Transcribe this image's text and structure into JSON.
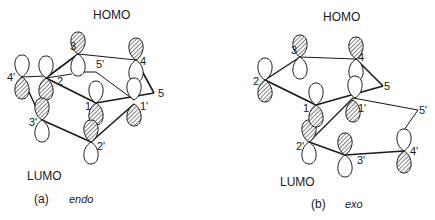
{
  "panels": [
    {
      "id": "a",
      "caption_letter": "(a)",
      "caption_name": "endo",
      "homo_label": "HOMO",
      "lumo_label": "LUMO",
      "atoms": [
        {
          "label": "3",
          "x": 78,
          "y": 54
        },
        {
          "label": "4",
          "x": 136,
          "y": 60
        },
        {
          "label": "2",
          "x": 46,
          "y": 78
        },
        {
          "label": "4'",
          "x": 22,
          "y": 77
        },
        {
          "label": "5'",
          "x": 91,
          "y": 72
        },
        {
          "label": "5",
          "x": 154,
          "y": 93
        },
        {
          "label": "1",
          "x": 96,
          "y": 103
        },
        {
          "label": "1'",
          "x": 134,
          "y": 100
        },
        {
          "label": "3'",
          "x": 42,
          "y": 120
        },
        {
          "label": "2'",
          "x": 91,
          "y": 142
        }
      ]
    },
    {
      "id": "b",
      "caption_letter": "(b)",
      "caption_name": "exo",
      "homo_label": "HOMO",
      "lumo_label": "LUMO",
      "atoms": [
        {
          "label": "3",
          "x": 300,
          "y": 57
        },
        {
          "label": "4",
          "x": 356,
          "y": 59
        },
        {
          "label": "2",
          "x": 265,
          "y": 80
        },
        {
          "label": "5",
          "x": 383,
          "y": 86
        },
        {
          "label": "1",
          "x": 316,
          "y": 105
        },
        {
          "label": "1'",
          "x": 353,
          "y": 98
        },
        {
          "label": "5'",
          "x": 418,
          "y": 110
        },
        {
          "label": "2'",
          "x": 309,
          "y": 142
        },
        {
          "label": "3'",
          "x": 345,
          "y": 155
        },
        {
          "label": "4'",
          "x": 404,
          "y": 151
        }
      ]
    }
  ]
}
